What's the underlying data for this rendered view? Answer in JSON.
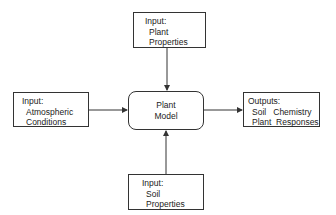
{
  "diagram": {
    "nodes": {
      "top": {
        "lines": [
          "Input:",
          "Plant",
          "Properties"
        ]
      },
      "left": {
        "lines": [
          "Input:",
          "Atmospheric",
          "Conditions"
        ]
      },
      "center": {
        "lines": [
          "Plant",
          "Model"
        ]
      },
      "right": {
        "lines": [
          "Outputs:",
          "Soil   Chemistry",
          "Plant  Responses"
        ]
      },
      "bottom": {
        "lines": [
          "Input:",
          "Soil",
          "Properties"
        ]
      }
    },
    "edges": [
      {
        "from": "top",
        "to": "center"
      },
      {
        "from": "left",
        "to": "center"
      },
      {
        "from": "bottom",
        "to": "center"
      },
      {
        "from": "center",
        "to": "right"
      }
    ],
    "colors": {
      "stroke": "#333333",
      "background": "#ffffff"
    }
  }
}
